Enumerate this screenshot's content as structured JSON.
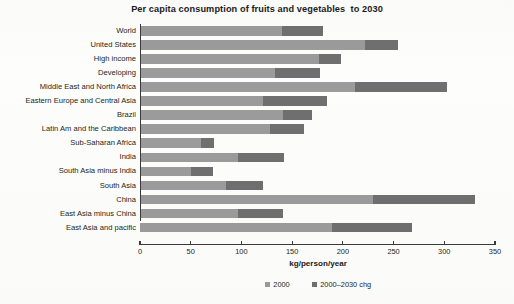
{
  "chart_data": {
    "type": "bar",
    "orientation": "horizontal",
    "stacked": true,
    "title": "Per capita consumption of fruits and vegetables  to 2030",
    "xlabel": "kg/person/year",
    "ylabel": "",
    "xlim": [
      0,
      350
    ],
    "xticks": [
      0,
      50,
      100,
      150,
      200,
      250,
      300,
      350
    ],
    "xtick_labels": [
      "0",
      "50",
      "100",
      "150",
      "200",
      "250",
      "300",
      "350"
    ],
    "grid": false,
    "legend_position": "bottom",
    "categories": [
      "World",
      "United States",
      "High income",
      "Developing",
      "Middle East and North Africa",
      "Eastern Europe and Central Asia",
      "Brazil",
      "Latin Am and the Caribbean",
      "Sub-Saharan Africa",
      "India",
      "South Asia minus India",
      "South Asia",
      "China",
      "East Asia minus China",
      "East Asia and pacific"
    ],
    "series": [
      {
        "name": "2000",
        "color": "#9b9b9b",
        "values": [
          140,
          222,
          176,
          133,
          212,
          121,
          141,
          128,
          60,
          97,
          50,
          85,
          230,
          97,
          189
        ]
      },
      {
        "name": "2000–2030 chg",
        "color": "#6f6f6f",
        "values": [
          40,
          32,
          22,
          44,
          91,
          63,
          29,
          34,
          13,
          45,
          22,
          36,
          100,
          44,
          79
        ]
      }
    ],
    "totals": [
      180,
      254,
      198,
      177,
      303,
      184,
      170,
      162,
      73,
      142,
      72,
      121,
      330,
      141,
      268
    ]
  },
  "legend": {
    "items": [
      {
        "label": "2000",
        "color": "#9b9b9b"
      },
      {
        "label": "2000–2030 chg",
        "color": "#6f6f6f"
      }
    ]
  }
}
